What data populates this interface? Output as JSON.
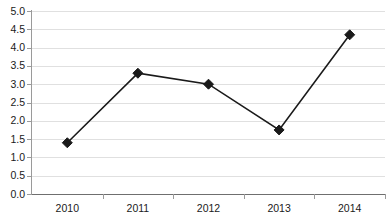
{
  "chart_data": {
    "type": "line",
    "title": "",
    "xlabel": "",
    "ylabel": "",
    "categories": [
      "2010",
      "2011",
      "2012",
      "2013",
      "2014"
    ],
    "values": [
      1.4,
      3.3,
      3.0,
      1.75,
      4.35
    ],
    "series": [
      {
        "name": "Series 1",
        "values": [
          1.4,
          3.3,
          3.0,
          1.75,
          4.35
        ]
      }
    ],
    "ylim": [
      0.0,
      5.0
    ],
    "ytick_step": 0.5,
    "yticks": [
      "0.0",
      "0.5",
      "1.0",
      "1.5",
      "2.0",
      "2.5",
      "3.0",
      "3.5",
      "4.0",
      "4.5",
      "5.0"
    ],
    "grid": true,
    "grid_axis": "y",
    "legend": false,
    "legend_position": "none",
    "marker_shape": "diamond",
    "series_color": "#1a1a1a",
    "grid_color": "#e0e0e0",
    "axis_color": "#9a9a9a",
    "background_color": "#ffffff"
  }
}
